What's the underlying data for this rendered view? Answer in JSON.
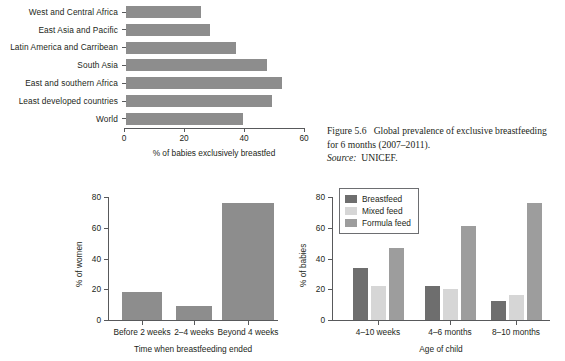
{
  "caption": {
    "figure_label": "Figure 5.6",
    "text": "Global prevalence of exclusive breastfeeding for 6 months (2007–2011).",
    "source_label": "Source:",
    "source_value": "UNICEF."
  },
  "colors": {
    "bar_gray": "#8d8d8d",
    "breastfeed": "#6e6e6e",
    "mixed_feed": "#d6d6d6",
    "formula_feed": "#9d9d9d",
    "axis": "#58595b",
    "text": "#231f20"
  },
  "chart_data": [
    {
      "id": "global-prevalence-bar",
      "type": "bar",
      "orientation": "horizontal",
      "title": "",
      "xlabel": "% of babies exclusively breastfed",
      "ylabel": "",
      "xlim": [
        0,
        60
      ],
      "xticks": [
        0,
        20,
        40,
        60
      ],
      "grid": false,
      "legend": "none",
      "categories": [
        "West and Central Africa",
        "East Asia and Pacific",
        "Latin America and Carribean",
        "South Asia",
        "East and southern Africa",
        "Least developed countries",
        "World"
      ],
      "values": [
        25,
        28,
        36.5,
        47,
        52,
        48.5,
        39
      ]
    },
    {
      "id": "time-breastfeeding-ended",
      "type": "bar",
      "orientation": "vertical",
      "title": "",
      "xlabel": "Time when breastfeeding ended",
      "ylabel": "% of women",
      "ylim": [
        0,
        80
      ],
      "yticks": [
        0,
        20,
        40,
        60,
        80
      ],
      "grid": false,
      "legend": "none",
      "categories": [
        "Before 2 weeks",
        "2–4 weeks",
        "Beyond 4 weeks"
      ],
      "values": [
        18,
        9,
        76
      ]
    },
    {
      "id": "feeding-by-age",
      "type": "bar",
      "orientation": "vertical",
      "title": "",
      "xlabel": "Age of child",
      "ylabel": "% of babies",
      "ylim": [
        0,
        80
      ],
      "yticks": [
        0,
        20,
        40,
        60,
        80
      ],
      "grid": false,
      "legend": "top-left",
      "categories": [
        "4–10 weeks",
        "4–6 months",
        "8–10 months"
      ],
      "series": [
        {
          "name": "Breastfeed",
          "values": [
            34,
            22,
            12.5
          ]
        },
        {
          "name": "Mixed feed",
          "values": [
            22,
            20,
            16.5
          ]
        },
        {
          "name": "Formula feed",
          "values": [
            47,
            61,
            76
          ]
        }
      ]
    }
  ]
}
